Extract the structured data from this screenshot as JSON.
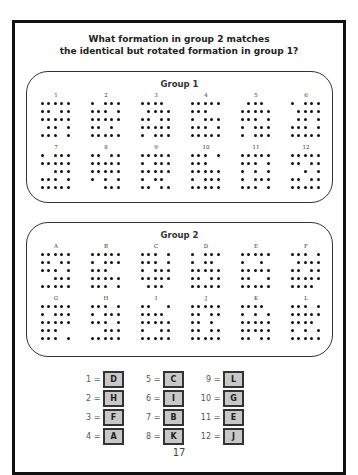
{
  "title": {
    "line1": "What formation in group 2 matches",
    "line2": "the identical but rotated formation in group 1?"
  },
  "group1": {
    "title": "Group 1",
    "items": [
      {
        "label": "1",
        "rows": [
          "11111",
          "11011",
          "11111",
          "01101",
          "11101"
        ]
      },
      {
        "label": "2",
        "rows": [
          "10111",
          "11101",
          "11111",
          "11010",
          "11111"
        ]
      },
      {
        "label": "3",
        "rows": [
          "11110",
          "01111",
          "11011",
          "11111",
          "10111"
        ]
      },
      {
        "label": "4",
        "rows": [
          "11111",
          "11100",
          "10111",
          "11101",
          "11111"
        ]
      },
      {
        "label": "5",
        "rows": [
          "01110",
          "11111",
          "11101",
          "10111",
          "10111"
        ]
      },
      {
        "label": "6",
        "rows": [
          "10111",
          "01111",
          "01101",
          "11101",
          "11111"
        ]
      },
      {
        "label": "7",
        "rows": [
          "10111",
          "11111",
          "00111",
          "11101",
          "11111"
        ]
      },
      {
        "label": "8",
        "rows": [
          "11011",
          "11111",
          "11111",
          "10101",
          "00111"
        ]
      },
      {
        "label": "9",
        "rows": [
          "11111",
          "10111",
          "11111",
          "10110",
          "11011"
        ]
      },
      {
        "label": "10",
        "rows": [
          "11101",
          "11100",
          "11111",
          "10111",
          "11111"
        ]
      },
      {
        "label": "11",
        "rows": [
          "11111",
          "11101",
          "10101",
          "10111",
          "11101"
        ]
      },
      {
        "label": "12",
        "rows": [
          "11111",
          "11011",
          "00101",
          "11011",
          "11111"
        ]
      }
    ]
  },
  "group2": {
    "title": "Group 2",
    "items": [
      {
        "label": "A",
        "rows": [
          "11111",
          "11011",
          "11101",
          "00111",
          "11111"
        ]
      },
      {
        "label": "B",
        "rows": [
          "11111",
          "10111",
          "11100",
          "11111",
          "11101"
        ]
      },
      {
        "label": "C",
        "rows": [
          "11101",
          "11101",
          "10111",
          "11111",
          "01110"
        ]
      },
      {
        "label": "D",
        "rows": [
          "10111",
          "10110",
          "11111",
          "11011",
          "11111"
        ]
      },
      {
        "label": "E",
        "rows": [
          "11111",
          "10010",
          "11111",
          "11001",
          "11111"
        ]
      },
      {
        "label": "F",
        "rows": [
          "11101",
          "01111",
          "11011",
          "11111",
          "11110"
        ]
      },
      {
        "label": "G",
        "rows": [
          "11111",
          "10111",
          "11111",
          "11100",
          "11101"
        ]
      },
      {
        "label": "H",
        "rows": [
          "11101",
          "10111",
          "11101",
          "00111",
          "11111"
        ]
      },
      {
        "label": "I",
        "rows": [
          "11001",
          "11110",
          "11111",
          "10011",
          "11111"
        ]
      },
      {
        "label": "J",
        "rows": [
          "11111",
          "11011",
          "11010",
          "11011",
          "11111"
        ]
      },
      {
        "label": "K",
        "rows": [
          "11110",
          "10101",
          "11111",
          "11111",
          "11011"
        ]
      },
      {
        "label": "L",
        "rows": [
          "11101",
          "11111",
          "11110",
          "10101",
          "11111"
        ]
      }
    ]
  },
  "answers": [
    {
      "num": "1",
      "eq": "=",
      "val": "D"
    },
    {
      "num": "5",
      "eq": "=",
      "val": "C"
    },
    {
      "num": "9",
      "eq": "=",
      "val": "L"
    },
    {
      "num": "2",
      "eq": "=",
      "val": "H"
    },
    {
      "num": "6",
      "eq": "=",
      "val": "I"
    },
    {
      "num": "10",
      "eq": "=",
      "val": "G"
    },
    {
      "num": "3",
      "eq": "=",
      "val": "F"
    },
    {
      "num": "7",
      "eq": "=",
      "val": "B"
    },
    {
      "num": "11",
      "eq": "=",
      "val": "E"
    },
    {
      "num": "4",
      "eq": "=",
      "val": "A"
    },
    {
      "num": "8",
      "eq": "=",
      "val": "K"
    },
    {
      "num": "12",
      "eq": "=",
      "val": "J"
    }
  ],
  "page_number": "17"
}
